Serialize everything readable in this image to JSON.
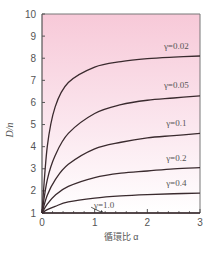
{
  "chart_data": {
    "type": "line",
    "title": "",
    "xlabel": "循環比 α",
    "ylabel": "D/n",
    "xlim": [
      0,
      3
    ],
    "ylim": [
      1,
      10
    ],
    "x_ticks": [
      "0",
      "1",
      "2",
      "3"
    ],
    "y_ticks": [
      "1",
      "2",
      "3",
      "4",
      "5",
      "6",
      "7",
      "8",
      "9",
      "10"
    ],
    "grid": false,
    "background": "pink-to-white vertical gradient",
    "colors": {
      "curve": "#3a2a2e",
      "axis": "#555555",
      "bg_top": "#f7c9d8",
      "bg_bottom": "#ffffff"
    },
    "series": [
      {
        "name": "γ=0.02",
        "label": "γ=0.02",
        "gamma": 0.02,
        "x": [
          0,
          0.1,
          0.25,
          0.5,
          1,
          1.5,
          2,
          2.5,
          3
        ],
        "values": [
          1,
          4.0,
          5.8,
          6.9,
          7.6,
          7.85,
          7.98,
          8.05,
          8.1
        ]
      },
      {
        "name": "γ=0.05",
        "label": "γ=0.05",
        "gamma": 0.05,
        "x": [
          0,
          0.1,
          0.25,
          0.5,
          1,
          1.5,
          2,
          2.5,
          3
        ],
        "values": [
          1,
          2.5,
          3.6,
          4.6,
          5.5,
          5.9,
          6.1,
          6.2,
          6.3
        ]
      },
      {
        "name": "γ=0.1",
        "label": "γ=0.1",
        "gamma": 0.1,
        "x": [
          0,
          0.1,
          0.25,
          0.5,
          1,
          1.5,
          2,
          2.5,
          3
        ],
        "values": [
          1,
          1.8,
          2.5,
          3.2,
          3.9,
          4.2,
          4.4,
          4.5,
          4.6
        ]
      },
      {
        "name": "γ=0.2",
        "label": "γ=0.2",
        "gamma": 0.2,
        "x": [
          0,
          0.1,
          0.25,
          0.5,
          1,
          1.5,
          2,
          2.5,
          3
        ],
        "values": [
          1,
          1.4,
          1.8,
          2.2,
          2.6,
          2.8,
          2.9,
          3.0,
          3.05
        ]
      },
      {
        "name": "γ=0.4",
        "label": "γ=0.4",
        "gamma": 0.4,
        "x": [
          0,
          0.1,
          0.25,
          0.5,
          1,
          1.5,
          2,
          2.5,
          3
        ],
        "values": [
          1,
          1.15,
          1.3,
          1.5,
          1.67,
          1.77,
          1.83,
          1.87,
          1.9
        ]
      },
      {
        "name": "γ=1.0",
        "label": "γ=1.0",
        "gamma": 1.0,
        "x": [
          0,
          3
        ],
        "values": [
          1,
          1
        ]
      }
    ],
    "annotations": [
      {
        "text": "γ=0.02",
        "x": 2.55,
        "y": 8.55
      },
      {
        "text": "γ=0.05",
        "x": 2.55,
        "y": 6.8
      },
      {
        "text": "γ=0.1",
        "x": 2.55,
        "y": 5.05
      },
      {
        "text": "γ=0.2",
        "x": 2.55,
        "y": 3.5
      },
      {
        "text": "γ=0.4",
        "x": 2.55,
        "y": 2.35
      },
      {
        "text": "γ=1.0",
        "x": 1.18,
        "y": 1.35,
        "arrow_to": [
          1.1,
          1.0
        ]
      }
    ]
  }
}
